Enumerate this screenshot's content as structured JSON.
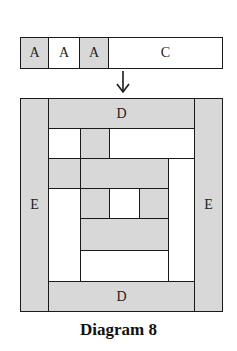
{
  "strip": {
    "cells": [
      {
        "label": "A",
        "fill": "gray"
      },
      {
        "label": "A",
        "fill": "white"
      },
      {
        "label": "A",
        "fill": "gray"
      },
      {
        "label": "C",
        "fill": "white"
      }
    ]
  },
  "arrow": {
    "icon": "down-arrow-icon"
  },
  "block": {
    "top_label": "D",
    "bottom_label": "D",
    "left_label": "E",
    "right_label": "E"
  },
  "caption": "Diagram 8",
  "colors": {
    "gray": "#d8d8d8",
    "white": "#ffffff",
    "line": "#1a1a1a"
  }
}
